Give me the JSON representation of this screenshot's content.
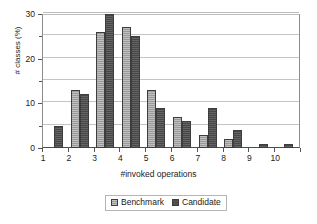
{
  "chart_data": {
    "type": "bar",
    "title": "",
    "xlabel": "#invoked operations",
    "ylabel": "# classes (%)",
    "categories": [
      "1",
      "2",
      "3",
      "4",
      "5",
      "6",
      "7",
      "8",
      "9",
      "10"
    ],
    "series": [
      {
        "name": "Benchmark",
        "color": "#a3a3a3",
        "values": [
          0,
          13,
          26,
          27,
          13,
          7,
          3,
          2,
          0,
          0
        ]
      },
      {
        "name": "Candidate",
        "color": "#4f4f4f",
        "values": [
          5,
          12,
          30,
          25,
          9,
          6,
          9,
          4,
          1,
          1
        ]
      }
    ],
    "ylim": [
      0,
      30
    ],
    "y_ticks": [
      0,
      10,
      20,
      30
    ],
    "y_ticks_minor": [
      5,
      15,
      25
    ],
    "y_tick_labels": [
      "0",
      "10",
      "20",
      "30"
    ],
    "gridlines": [
      5,
      10,
      15,
      20,
      25,
      30
    ],
    "grid": true,
    "legend_position": "bottom",
    "legend_entries": [
      "Benchmark",
      "Candidate"
    ]
  }
}
